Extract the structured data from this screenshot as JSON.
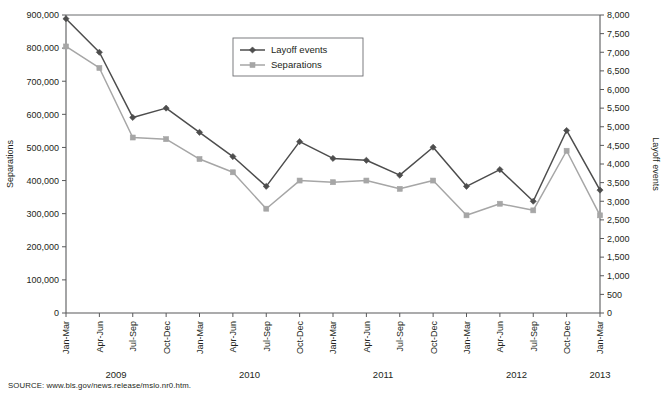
{
  "source_note": "SOURCE: www.bls.gov/news.release/mslo.nr0.htm.",
  "legend": {
    "series1_label": "Layoff events",
    "series2_label": "Separations"
  },
  "axes": {
    "left_title": "Separations",
    "right_title": "Layoff events",
    "left_ticks": [
      "0",
      "100,000",
      "200,000",
      "300,000",
      "400,000",
      "500,000",
      "600,000",
      "700,000",
      "800,000",
      "900,000"
    ],
    "right_ticks": [
      "0",
      "500",
      "1,000",
      "1,500",
      "2,000",
      "2,500",
      "3,000",
      "3,500",
      "4,000",
      "4,500",
      "5,000",
      "5,500",
      "6,000",
      "6,500",
      "7,000",
      "7,500",
      "8,000"
    ]
  },
  "colors": {
    "layoff_events": "#4d4d4d",
    "separations": "#a6a6a6",
    "axis": "#58595b",
    "text": "#231f20"
  },
  "year_groups": [
    {
      "label": "2009",
      "start_index": 0,
      "end_index": 3
    },
    {
      "label": "2010",
      "start_index": 4,
      "end_index": 7
    },
    {
      "label": "2011",
      "start_index": 8,
      "end_index": 11
    },
    {
      "label": "2012",
      "start_index": 12,
      "end_index": 15
    },
    {
      "label": "2013",
      "start_index": 16,
      "end_index": 16
    }
  ],
  "chart_data": {
    "type": "line",
    "title": "",
    "xlabel": "",
    "categories": [
      "Jan-Mar",
      "Apr-Jun",
      "Jul-Sep",
      "Oct-Dec",
      "Jan-Mar",
      "Apr-Jun",
      "Jul-Sep",
      "Oct-Dec",
      "Jan-Mar",
      "Apr-Jun",
      "Jul-Sep",
      "Oct-Dec",
      "Jan-Mar",
      "Apr-Jun",
      "Jul-Sep",
      "Oct-Dec",
      "Jan-Mar"
    ],
    "grid": false,
    "legend_position": "top-center",
    "series": [
      {
        "name": "Layoff events",
        "axis": "right",
        "ylabel": "Layoff events",
        "ylim": [
          0,
          8000
        ],
        "marker": "diamond",
        "color": "#4d4d4d",
        "values": [
          7900,
          7000,
          5250,
          5500,
          4850,
          4200,
          3400,
          4600,
          4150,
          4100,
          3700,
          4450,
          3400,
          3850,
          3000,
          4900,
          3300
        ]
      },
      {
        "name": "Separations",
        "axis": "left",
        "ylabel": "Separations",
        "ylim": [
          0,
          900000
        ],
        "marker": "square",
        "color": "#a6a6a6",
        "values": [
          805000,
          740000,
          530000,
          525000,
          465000,
          425000,
          315000,
          400000,
          395000,
          400000,
          375000,
          400000,
          295000,
          330000,
          310000,
          490000,
          295000
        ]
      }
    ]
  }
}
